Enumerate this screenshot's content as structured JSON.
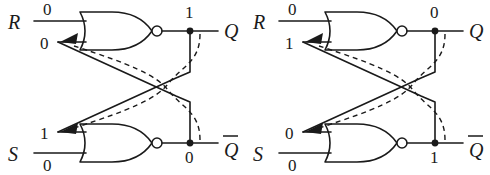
{
  "figure": {
    "type": "logic-circuit-diagram",
    "gate_type": "NOR",
    "colors": {
      "background": "#ffffff",
      "line": "#1a1a1a"
    }
  },
  "circuits": [
    {
      "id": "left",
      "inputs": {
        "r_label": "R",
        "r_value": "0",
        "s_label": "S",
        "s_value": "0"
      },
      "feedback": {
        "top_value": "0",
        "bottom_value": "1"
      },
      "outputs": {
        "q_label": "Q",
        "q_value": "1",
        "qbar_label": "Q",
        "qbar_value": "0"
      }
    },
    {
      "id": "right",
      "inputs": {
        "r_label": "R",
        "r_value": "0",
        "s_label": "S",
        "s_value": "0"
      },
      "feedback": {
        "top_value": "1",
        "bottom_value": "0"
      },
      "outputs": {
        "q_label": "Q",
        "q_value": "0",
        "qbar_label": "Q",
        "qbar_value": "1"
      }
    }
  ]
}
